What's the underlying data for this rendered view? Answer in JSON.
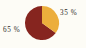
{
  "chart_data": {
    "type": "pie",
    "title": "",
    "labels": [
      "35 %",
      "65 %"
    ],
    "categories": [
      "Segment A",
      "Segment B"
    ],
    "values": [
      35,
      65
    ],
    "units": "%",
    "colors": [
      "#ECAE3C",
      "#86251F"
    ],
    "start_angle_deg": 0,
    "direction": "clockwise",
    "legend": "none",
    "grid": false,
    "annotations": [
      {
        "text": "35 %",
        "position": "upper-right",
        "slice_index": 0
      },
      {
        "text": "65 %",
        "position": "lower-left",
        "slice_index": 1
      }
    ]
  },
  "figure": {
    "background_color": "#FDFCF6",
    "label_color": "#2E2A28",
    "slices": [
      {
        "name": "gold-slice",
        "label": "35 %",
        "value": 35,
        "color": "#ECAE3C"
      },
      {
        "name": "maroon-slice",
        "label": "65 %",
        "value": 65,
        "color": "#86251F"
      }
    ]
  }
}
